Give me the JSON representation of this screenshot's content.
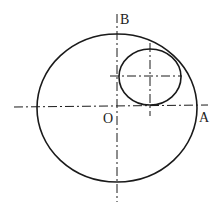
{
  "diagram": {
    "labels": {
      "origin": "O",
      "point_a": "A",
      "point_b": "B"
    },
    "colors": {
      "stroke": "#1a1a1a",
      "background": "#ffffff"
    },
    "shapes": {
      "large_ellipse": {
        "cx": 117,
        "cy": 108,
        "rx": 80,
        "ry": 74
      },
      "small_ellipse": {
        "cx": 150,
        "cy": 77,
        "rx": 31,
        "ry": 28
      }
    }
  }
}
